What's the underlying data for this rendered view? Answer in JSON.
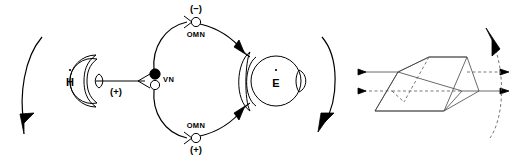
{
  "figure": {
    "background_color": "#ffffff",
    "line_color": "#000000",
    "dashed_color": "#555555",
    "prism_color": "#444444"
  },
  "left_organ": {
    "label": "H",
    "overdot": "˙",
    "name": "head-labyrinth",
    "polarity_label": "(+)",
    "rotation_arrow": "head-rotation-arc-arrow"
  },
  "ganglion": {
    "label": "VN",
    "name": "vestibular-nucleus",
    "filled_node": "excitatory-neuron",
    "open_node": "inhibitory-neuron"
  },
  "upper_pathway": {
    "sign": "(−)",
    "nerve_label": "OMN",
    "name": "upper-oculomotor-pathway"
  },
  "lower_pathway": {
    "sign": "(+)",
    "nerve_label": "OMN",
    "name": "lower-oculomotor-pathway"
  },
  "right_organ": {
    "label": "E",
    "overdot": "˙",
    "name": "eye-globe",
    "rotation_arrow": "eye-rotation-arc-arrow"
  },
  "prism": {
    "name": "optical-prism",
    "input_rays": 2,
    "output_rays": 2,
    "rotation_arrow": "prism-rotation-arc-arrow"
  }
}
